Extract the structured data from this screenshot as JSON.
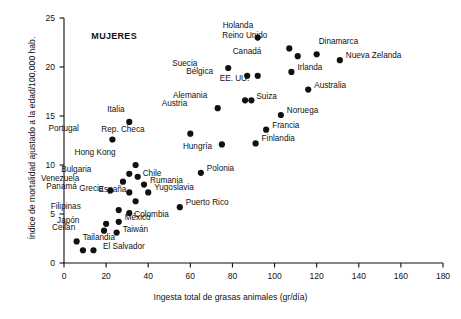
{
  "chart_data": {
    "type": "scatter",
    "title": "",
    "annotation": "MUJERES",
    "xlabel": "Ingesta total de grasas animales (gr/día)",
    "ylabel": "Índice de mortalidad ajustado a la edad/100,000 hab.",
    "xlim": [
      0,
      180
    ],
    "ylim": [
      0,
      25
    ],
    "xticks": [
      0,
      20,
      40,
      60,
      80,
      100,
      120,
      140,
      160,
      180
    ],
    "yticks": [
      0,
      5,
      10,
      15,
      20,
      25
    ],
    "grid": false,
    "legend": "none",
    "marker": "filled-circle",
    "marker_color": "#111111",
    "points": [
      {
        "label": "Holanda",
        "x": 92,
        "y": 23.0,
        "lx": -8,
        "ly": -13,
        "anchor": "left"
      },
      {
        "label": "Reino Unido",
        "x": 107,
        "y": 21.9,
        "lx": -26,
        "ly": -13,
        "anchor": "left"
      },
      {
        "label": "Dinamarca",
        "x": 120,
        "y": 21.3,
        "lx": 2,
        "ly": -13,
        "anchor": "left"
      },
      {
        "label": "Canadá",
        "x": 111,
        "y": 21.1,
        "lx": -40,
        "ly": -5,
        "anchor": "left"
      },
      {
        "label": "Nueva Zelanda",
        "x": 131,
        "y": 20.7,
        "lx": 6,
        "ly": -5,
        "anchor": "left"
      },
      {
        "label": "Suecia",
        "x": 78,
        "y": 19.9,
        "lx": -35,
        "ly": -5,
        "anchor": "left"
      },
      {
        "label": "Irlanda",
        "x": 108,
        "y": 19.5,
        "lx": 6,
        "ly": -5,
        "anchor": "left"
      },
      {
        "label": "Bélgica",
        "x": 87,
        "y": 19.1,
        "lx": -38,
        "ly": -5,
        "anchor": "left"
      },
      {
        "label": "EE. UU.",
        "x": 92,
        "y": 19.1,
        "lx": -12,
        "ly": 2,
        "anchor": "left"
      },
      {
        "label": "Australia",
        "x": 116,
        "y": 17.7,
        "lx": 6,
        "ly": -5,
        "anchor": "left"
      },
      {
        "label": "Alemania",
        "x": 86,
        "y": 16.6,
        "lx": -42,
        "ly": -5,
        "anchor": "left"
      },
      {
        "label": "Suiza",
        "x": 89,
        "y": 16.6,
        "lx": 5,
        "ly": -4,
        "anchor": "left"
      },
      {
        "label": "Austria",
        "x": 73,
        "y": 15.8,
        "lx": -35,
        "ly": -5,
        "anchor": "left"
      },
      {
        "label": "Italia",
        "x": 31,
        "y": 14.4,
        "lx": -9,
        "ly": -13,
        "anchor": "left"
      },
      {
        "label": "Noruega",
        "x": 103,
        "y": 15.1,
        "lx": 6,
        "ly": -5,
        "anchor": "left"
      },
      {
        "label": "Francia",
        "x": 96,
        "y": 13.6,
        "lx": 6,
        "ly": -5,
        "anchor": "left"
      },
      {
        "label": "Rep. Checa",
        "x": 60,
        "y": 13.2,
        "lx": -50,
        "ly": -5,
        "anchor": "left"
      },
      {
        "label": "Portugal",
        "x": 23,
        "y": 12.6,
        "lx": -37,
        "ly": -12,
        "anchor": "left"
      },
      {
        "label": "Finlandia",
        "x": 91,
        "y": 12.2,
        "lx": 6,
        "ly": -5,
        "anchor": "left"
      },
      {
        "label": "Hungría",
        "x": 75,
        "y": 12.1,
        "lx": -14,
        "ly": 2,
        "anchor": "left"
      },
      {
        "label": "Hong Kong",
        "x": 34,
        "y": 10.0,
        "lx": -24,
        "ly": -13,
        "anchor": "left"
      },
      {
        "label": "Polonia",
        "x": 65,
        "y": 9.2,
        "lx": 6,
        "ly": -5,
        "anchor": "left"
      },
      {
        "label": "Bulgaria",
        "x": 31,
        "y": 9.1,
        "lx": -42,
        "ly": -5,
        "anchor": "left"
      },
      {
        "label": "Chile",
        "x": 35,
        "y": 8.8,
        "lx": 5,
        "ly": -4,
        "anchor": "left"
      },
      {
        "label": "Venezuela",
        "x": 28,
        "y": 8.3,
        "lx": -48,
        "ly": -4,
        "anchor": "left"
      },
      {
        "label": "Rumania",
        "x": 38,
        "y": 8.0,
        "lx": 6,
        "ly": -5,
        "anchor": "left"
      },
      {
        "label": "Yugoslavia",
        "x": 40,
        "y": 7.2,
        "lx": 6,
        "ly": -5,
        "anchor": "left"
      },
      {
        "label": "Panamá",
        "x": 22,
        "y": 7.4,
        "lx": -37,
        "ly": -4,
        "anchor": "left"
      },
      {
        "label": "Grecia",
        "x": 31,
        "y": 7.2,
        "lx": -30,
        "ly": -4,
        "anchor": "left"
      },
      {
        "label": "España",
        "x": 34,
        "y": 6.3,
        "lx": -13,
        "ly": -12,
        "anchor": "left"
      },
      {
        "label": "Puerto Rico",
        "x": 55,
        "y": 5.7,
        "lx": 6,
        "ly": -5,
        "anchor": "left"
      },
      {
        "label": "Filipinas",
        "x": 26,
        "y": 5.4,
        "lx": -42,
        "ly": -4,
        "anchor": "left"
      },
      {
        "label": "Colombia",
        "x": 31,
        "y": 5.1,
        "lx": 5,
        "ly": 1,
        "anchor": "left"
      },
      {
        "label": "México",
        "x": 26,
        "y": 4.2,
        "lx": 6,
        "ly": -5,
        "anchor": "left"
      },
      {
        "label": "Japón",
        "x": 20,
        "y": 4.0,
        "lx": -31,
        "ly": -4,
        "anchor": "left"
      },
      {
        "label": "Ceilán",
        "x": 19,
        "y": 3.3,
        "lx": -33,
        "ly": -4,
        "anchor": "left"
      },
      {
        "label": "Taiwán",
        "x": 25,
        "y": 3.1,
        "lx": 6,
        "ly": -4,
        "anchor": "left"
      },
      {
        "label": "Tailandia",
        "x": 6,
        "y": 2.2,
        "lx": 6,
        "ly": -4,
        "anchor": "left"
      },
      {
        "label": "El Salvador",
        "x": 9,
        "y": 1.3,
        "lx": 20,
        "ly": -4,
        "anchor": "left"
      },
      {
        "label": "",
        "x": 14,
        "y": 1.3,
        "lx": 0,
        "ly": 0,
        "anchor": "left"
      }
    ]
  }
}
